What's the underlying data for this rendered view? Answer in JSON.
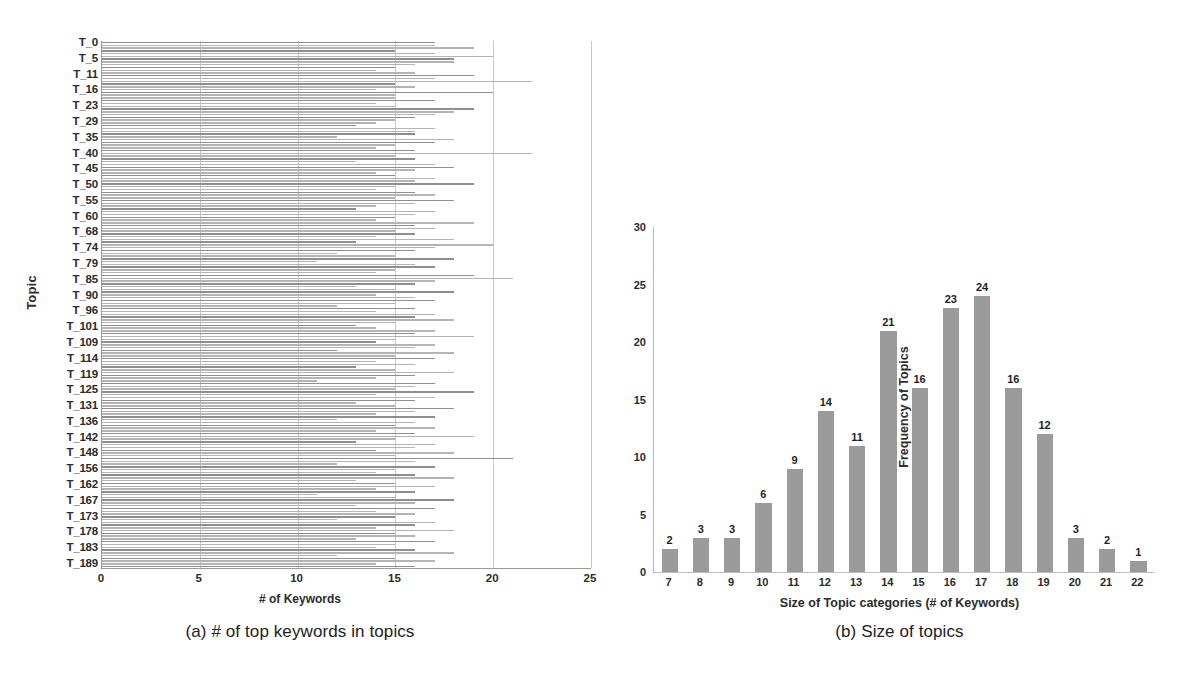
{
  "panel_a": {
    "caption": "(a) # of top keywords in topics",
    "ylabel": "Topic",
    "xlabel": "# of Keywords",
    "chart_data": {
      "type": "bar",
      "orientation": "horizontal",
      "title": "(a) # of top keywords in topics",
      "xlabel": "# of Keywords",
      "ylabel": "Topic",
      "xlim": [
        0,
        25
      ],
      "xticks": [
        0,
        5,
        10,
        15,
        20,
        25
      ],
      "ytick_labels": [
        "T_0",
        "T_5",
        "T_11",
        "T_16",
        "T_23",
        "T_29",
        "T_35",
        "T_40",
        "T_45",
        "T_50",
        "T_55",
        "T_60",
        "T_68",
        "T_74",
        "T_79",
        "T_85",
        "T_90",
        "T_96",
        "T_101",
        "T_109",
        "T_114",
        "T_119",
        "T_125",
        "T_131",
        "T_136",
        "T_142",
        "T_148",
        "T_156",
        "T_162",
        "T_167",
        "T_173",
        "T_178",
        "T_183",
        "T_189"
      ],
      "grid": "vertical",
      "n_bars": 190,
      "bar_color": "#b4b4b4",
      "values": [
        17,
        17,
        19,
        15,
        17,
        20,
        18,
        18,
        16,
        15,
        14,
        16,
        19,
        17,
        22,
        15,
        16,
        14,
        20,
        15,
        15,
        17,
        14,
        15,
        19,
        18,
        17,
        16,
        15,
        14,
        13,
        17,
        16,
        16,
        12,
        18,
        17,
        15,
        14,
        16,
        22,
        15,
        16,
        13,
        17,
        18,
        16,
        14,
        15,
        17,
        16,
        19,
        15,
        14,
        16,
        17,
        15,
        18,
        16,
        14,
        13,
        17,
        16,
        15,
        14,
        19,
        16,
        17,
        15,
        16,
        14,
        18,
        13,
        20,
        17,
        16,
        12,
        15,
        18,
        11,
        16,
        17,
        15,
        14,
        19,
        21,
        17,
        16,
        13,
        15,
        18,
        14,
        16,
        17,
        15,
        12,
        16,
        14,
        17,
        16,
        18,
        15,
        13,
        14,
        17,
        16,
        19,
        15,
        14,
        17,
        16,
        12,
        18,
        15,
        17,
        14,
        16,
        13,
        15,
        18,
        16,
        14,
        11,
        17,
        16,
        15,
        19,
        14,
        17,
        16,
        13,
        15,
        18,
        16,
        14,
        17,
        12,
        16,
        15,
        17,
        14,
        16,
        19,
        15,
        13,
        17,
        16,
        14,
        18,
        15,
        21,
        16,
        12,
        17,
        15,
        14,
        16,
        18,
        13,
        15,
        17,
        14,
        16,
        11,
        15,
        18,
        16,
        13,
        17,
        14,
        16,
        15,
        12,
        17,
        16,
        14,
        18,
        15,
        16,
        13,
        17,
        15,
        14,
        16,
        18,
        12,
        15,
        17,
        14,
        16
      ]
    },
    "xtick_labels": [
      "0",
      "5",
      "10",
      "15",
      "20",
      "25"
    ],
    "ytick_labels": [
      "T_0",
      "T_5",
      "T_11",
      "T_16",
      "T_23",
      "T_29",
      "T_35",
      "T_40",
      "T_45",
      "T_50",
      "T_55",
      "T_60",
      "T_68",
      "T_74",
      "T_79",
      "T_85",
      "T_90",
      "T_96",
      "T_101",
      "T_109",
      "T_114",
      "T_119",
      "T_125",
      "T_131",
      "T_136",
      "T_142",
      "T_148",
      "T_156",
      "T_162",
      "T_167",
      "T_173",
      "T_178",
      "T_183",
      "T_189"
    ]
  },
  "panel_b": {
    "caption": "(b) Size of topics",
    "ylabel": "Frequency of Topics",
    "xlabel": "Size of Topic categories (# of Keywords)",
    "chart_data": {
      "type": "bar",
      "orientation": "vertical",
      "title": "(b) Size of topics",
      "xlabel": "Size of Topic categories (# of Keywords)",
      "ylabel": "Frequency of Topics",
      "categories": [
        "7",
        "8",
        "9",
        "10",
        "11",
        "12",
        "13",
        "14",
        "15",
        "16",
        "17",
        "18",
        "19",
        "20",
        "21",
        "22"
      ],
      "values": [
        2,
        3,
        3,
        6,
        9,
        14,
        11,
        21,
        16,
        23,
        24,
        16,
        12,
        3,
        2,
        1
      ],
      "ylim": [
        0,
        30
      ],
      "yticks": [
        0,
        5,
        10,
        15,
        20,
        25,
        30
      ],
      "grid": "none",
      "legend": "none",
      "bar_color": "#9a9a9a",
      "data_labels": true
    },
    "ytick_labels": [
      "0",
      "5",
      "10",
      "15",
      "20",
      "25",
      "30"
    ]
  },
  "colors": {
    "background": "#ffffff",
    "bar_gray": "#9a9a9a",
    "bar_light": "#b4b4b4",
    "grid": "#c9c9c9",
    "axis": "#9a9a9a",
    "text": "#2b2b2b"
  }
}
